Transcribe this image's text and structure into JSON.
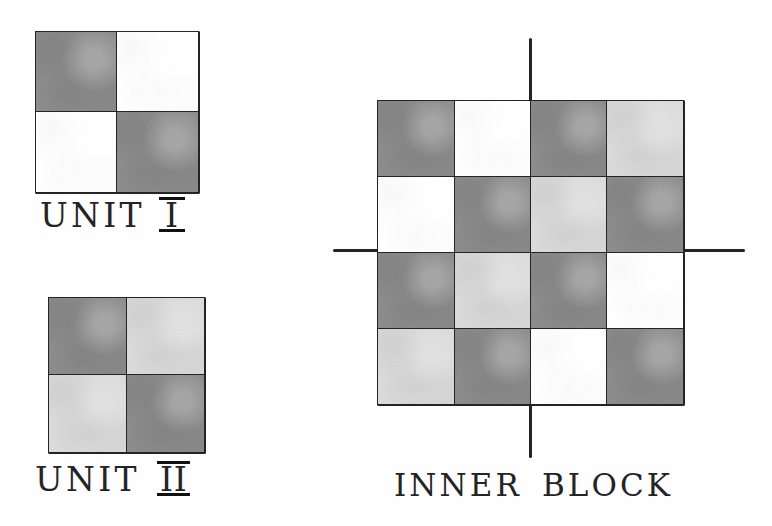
{
  "figure": {
    "style": "hand-drawn pencil and wash"
  },
  "palette": {
    "dark": "#8d8d8d",
    "light": "#dcdcdc",
    "white": "#ffffff",
    "ink": "#242424",
    "background": "#fefefe"
  },
  "units": [
    {
      "id": "unit-1",
      "caption_text": "UNIT",
      "caption_numeral": "I",
      "caption_full": "UNIT I",
      "rows": 2,
      "cols": 2,
      "cells": [
        [
          "dark",
          "white"
        ],
        [
          "white",
          "dark"
        ]
      ]
    },
    {
      "id": "unit-2",
      "caption_text": "UNIT",
      "caption_numeral": "II",
      "caption_full": "UNIT II",
      "rows": 2,
      "cols": 2,
      "cells": [
        [
          "dark",
          "light"
        ],
        [
          "light",
          "dark"
        ]
      ]
    }
  ],
  "inner_block": {
    "id": "inner-block",
    "caption_text": "INNER",
    "caption_word2": "BLOCK",
    "caption_full": "INNER BLOCK",
    "rows": 4,
    "cols": 4,
    "cells": [
      [
        "dark",
        "white",
        "dark",
        "light"
      ],
      [
        "white",
        "dark",
        "light",
        "dark"
      ],
      [
        "dark",
        "light",
        "dark",
        "white"
      ],
      [
        "light",
        "dark",
        "white",
        "dark"
      ]
    ],
    "axes": {
      "vertical_label": "vertical-center-line",
      "horizontal_label": "horizontal-center-line"
    }
  }
}
